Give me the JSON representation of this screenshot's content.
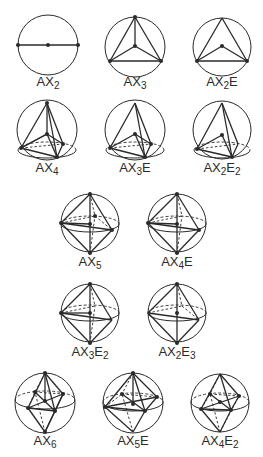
{
  "figure": {
    "ink_color": "#2a2a2a",
    "background": "#ffffff"
  },
  "diagrams": [
    {
      "id": "ax2",
      "label": {
        "base": "AX",
        "sub1": "2",
        "mid": "",
        "sub2": ""
      },
      "circle": {
        "cx": 48,
        "cy": 45,
        "r": 30
      },
      "label_pos": {
        "x": 48,
        "y": 86
      },
      "solid": [
        [
          18,
          45,
          78,
          45
        ]
      ],
      "dashed": [],
      "ellipses": [],
      "dots": [
        [
          18,
          45
        ],
        [
          48,
          45
        ],
        [
          78,
          45
        ]
      ]
    },
    {
      "id": "ax3",
      "label": {
        "base": "AX",
        "sub1": "3",
        "mid": "",
        "sub2": ""
      },
      "circle": {
        "cx": 135,
        "cy": 47,
        "r": 30
      },
      "label_pos": {
        "x": 135,
        "y": 86
      },
      "solid": [
        [
          135,
          17,
          110,
          61
        ],
        [
          135,
          17,
          161,
          61
        ],
        [
          110,
          61,
          161,
          61
        ],
        [
          135,
          17,
          135,
          46
        ],
        [
          135,
          46,
          110,
          61
        ],
        [
          135,
          46,
          161,
          61
        ]
      ],
      "dashed": [],
      "ellipses": [],
      "dots": [
        [
          135,
          17
        ],
        [
          135,
          46
        ],
        [
          110,
          61
        ],
        [
          161,
          61
        ]
      ]
    },
    {
      "id": "ax2e",
      "label": {
        "base": "AX",
        "sub1": "2",
        "mid": "E",
        "sub2": ""
      },
      "circle": {
        "cx": 222,
        "cy": 47,
        "r": 29
      },
      "label_pos": {
        "x": 222,
        "y": 86
      },
      "solid": [
        [
          222,
          18,
          197,
          61
        ],
        [
          222,
          18,
          247,
          61
        ],
        [
          197,
          61,
          247,
          61
        ],
        [
          222,
          46,
          197,
          61
        ],
        [
          222,
          46,
          247,
          61
        ]
      ],
      "dashed": [],
      "ellipses": [],
      "dots": [
        [
          222,
          46
        ],
        [
          197,
          61
        ],
        [
          247,
          61
        ]
      ]
    },
    {
      "id": "ax4",
      "label": {
        "base": "AX",
        "sub1": "4",
        "mid": "",
        "sub2": ""
      },
      "circle": {
        "cx": 47,
        "cy": 130,
        "r": 30
      },
      "label_pos": {
        "x": 47,
        "y": 172
      },
      "solid": [
        [
          47,
          103,
          21,
          148
        ],
        [
          47,
          103,
          57,
          157
        ],
        [
          47,
          103,
          63,
          144
        ],
        [
          47,
          103,
          47,
          134
        ],
        [
          47,
          134,
          21,
          148
        ],
        [
          47,
          134,
          57,
          157
        ],
        [
          47,
          134,
          63,
          144
        ],
        [
          21,
          148,
          57,
          157
        ],
        [
          57,
          157,
          63,
          144
        ],
        [
          21,
          148,
          47,
          134
        ]
      ],
      "dashed": [
        [
          21,
          148,
          63,
          144
        ]
      ],
      "ellipses": [
        {
          "cx": 47,
          "cy": 150,
          "rx": 29,
          "ry": 8,
          "dashed_back": true
        }
      ],
      "dots": [
        [
          47,
          103
        ],
        [
          47,
          134
        ],
        [
          21,
          148
        ],
        [
          57,
          157
        ],
        [
          63,
          144
        ]
      ]
    },
    {
      "id": "ax3e",
      "label": {
        "base": "AX",
        "sub1": "3",
        "mid": "E",
        "sub2": ""
      },
      "circle": {
        "cx": 135,
        "cy": 130,
        "r": 30
      },
      "label_pos": {
        "x": 135,
        "y": 172
      },
      "solid": [
        [
          135,
          103,
          110,
          148
        ],
        [
          135,
          103,
          145,
          157
        ],
        [
          135,
          103,
          151,
          144
        ],
        [
          135,
          134,
          110,
          148
        ],
        [
          135,
          134,
          145,
          157
        ],
        [
          135,
          134,
          151,
          144
        ],
        [
          110,
          148,
          145,
          157
        ],
        [
          145,
          157,
          151,
          144
        ]
      ],
      "dashed": [
        [
          110,
          148,
          151,
          144
        ]
      ],
      "ellipses": [
        {
          "cx": 135,
          "cy": 150,
          "rx": 29,
          "ry": 8,
          "dashed_back": true
        }
      ],
      "dots": [
        [
          135,
          134
        ],
        [
          110,
          148
        ],
        [
          145,
          157
        ],
        [
          151,
          144
        ]
      ]
    },
    {
      "id": "ax2e2",
      "label": {
        "base": "AX",
        "sub1": "2",
        "mid": "E",
        "sub2": "2"
      },
      "circle": {
        "cx": 222,
        "cy": 130,
        "r": 29
      },
      "label_pos": {
        "x": 222,
        "y": 172
      },
      "solid": [
        [
          222,
          103,
          197,
          149
        ],
        [
          222,
          103,
          232,
          157
        ],
        [
          222,
          103,
          238,
          144
        ],
        [
          222,
          135,
          197,
          149
        ],
        [
          222,
          135,
          232,
          157
        ],
        [
          197,
          149,
          232,
          157
        ],
        [
          232,
          157,
          238,
          144
        ]
      ],
      "dashed": [
        [
          197,
          149,
          238,
          144
        ]
      ],
      "ellipses": [
        {
          "cx": 222,
          "cy": 150,
          "rx": 28,
          "ry": 8,
          "dashed_back": true
        }
      ],
      "dots": [
        [
          222,
          135
        ],
        [
          197,
          149
        ],
        [
          232,
          157
        ]
      ]
    },
    {
      "id": "ax5",
      "label": {
        "base": "AX",
        "sub1": "5",
        "mid": "",
        "sub2": ""
      },
      "circle": {
        "cx": 90,
        "cy": 223,
        "r": 29
      },
      "label_pos": {
        "x": 90,
        "y": 266
      },
      "solid": [
        [
          90,
          194,
          61,
          223
        ],
        [
          90,
          194,
          112,
          230
        ],
        [
          90,
          253,
          61,
          223
        ],
        [
          90,
          253,
          112,
          230
        ],
        [
          90,
          194,
          90,
          253
        ],
        [
          61,
          223,
          112,
          230
        ],
        [
          61,
          223,
          90,
          224
        ]
      ],
      "dashed": [
        [
          90,
          194,
          95,
          216
        ],
        [
          90,
          253,
          95,
          216
        ],
        [
          61,
          223,
          95,
          216
        ],
        [
          95,
          216,
          112,
          230
        ]
      ],
      "ellipses": [
        {
          "cx": 90,
          "cy": 224,
          "rx": 29,
          "ry": 8,
          "dashed_back": true
        }
      ],
      "dots": [
        [
          90,
          194
        ],
        [
          90,
          253
        ],
        [
          90,
          224
        ],
        [
          61,
          223
        ],
        [
          112,
          230
        ],
        [
          95,
          216
        ]
      ]
    },
    {
      "id": "ax4e",
      "label": {
        "base": "AX",
        "sub1": "4",
        "mid": "E",
        "sub2": ""
      },
      "circle": {
        "cx": 177,
        "cy": 223,
        "r": 29
      },
      "label_pos": {
        "x": 177,
        "y": 266
      },
      "solid": [
        [
          177,
          194,
          148,
          223
        ],
        [
          177,
          194,
          199,
          230
        ],
        [
          177,
          253,
          148,
          223
        ],
        [
          177,
          253,
          199,
          230
        ],
        [
          177,
          194,
          177,
          253
        ],
        [
          148,
          223,
          199,
          230
        ],
        [
          148,
          223,
          177,
          224
        ]
      ],
      "dashed": [
        [
          177,
          194,
          182,
          216
        ],
        [
          177,
          253,
          182,
          216
        ],
        [
          148,
          223,
          182,
          216
        ]
      ],
      "ellipses": [
        {
          "cx": 177,
          "cy": 224,
          "rx": 29,
          "ry": 8,
          "dashed_back": true
        }
      ],
      "dots": [
        [
          177,
          194
        ],
        [
          177,
          253
        ],
        [
          177,
          224
        ],
        [
          148,
          223
        ],
        [
          199,
          230
        ]
      ]
    },
    {
      "id": "ax3e2",
      "label": {
        "base": "AX",
        "sub1": "3",
        "mid": "E",
        "sub2": "2"
      },
      "circle": {
        "cx": 90,
        "cy": 313,
        "r": 29
      },
      "label_pos": {
        "x": 90,
        "y": 356
      },
      "solid": [
        [
          90,
          284,
          61,
          313
        ],
        [
          90,
          284,
          112,
          320
        ],
        [
          90,
          343,
          61,
          313
        ],
        [
          90,
          343,
          112,
          320
        ],
        [
          90,
          284,
          90,
          343
        ],
        [
          61,
          313,
          112,
          320
        ],
        [
          61,
          313,
          90,
          313
        ]
      ],
      "dashed": [
        [
          90,
          284,
          95,
          306
        ],
        [
          90,
          343,
          95,
          306
        ],
        [
          61,
          313,
          95,
          306
        ]
      ],
      "ellipses": [
        {
          "cx": 90,
          "cy": 313,
          "rx": 29,
          "ry": 8,
          "dashed_back": true
        }
      ],
      "dots": [
        [
          90,
          284
        ],
        [
          90,
          343
        ],
        [
          90,
          313
        ],
        [
          61,
          313
        ]
      ]
    },
    {
      "id": "ax2e3",
      "label": {
        "base": "AX",
        "sub1": "2",
        "mid": "E",
        "sub2": "3"
      },
      "circle": {
        "cx": 177,
        "cy": 313,
        "r": 29
      },
      "label_pos": {
        "x": 177,
        "y": 356
      },
      "solid": [
        [
          177,
          284,
          148,
          313
        ],
        [
          177,
          284,
          199,
          320
        ],
        [
          177,
          343,
          148,
          313
        ],
        [
          177,
          343,
          199,
          320
        ],
        [
          177,
          284,
          177,
          343
        ],
        [
          148,
          313,
          199,
          320
        ]
      ],
      "dashed": [
        [
          177,
          284,
          182,
          306
        ],
        [
          148,
          313,
          182,
          306
        ],
        [
          182,
          306,
          199,
          320
        ]
      ],
      "ellipses": [
        {
          "cx": 177,
          "cy": 313,
          "rx": 29,
          "ry": 8,
          "dashed_back": true
        }
      ],
      "dots": [
        [
          177,
          284
        ],
        [
          177,
          343
        ],
        [
          177,
          313
        ]
      ]
    },
    {
      "id": "ax6",
      "label": {
        "base": "AX",
        "sub1": "6",
        "mid": "",
        "sub2": ""
      },
      "circle": {
        "cx": 45,
        "cy": 403,
        "r": 30
      },
      "label_pos": {
        "x": 45,
        "y": 445
      },
      "solid": [
        [
          45,
          373,
          28,
          408
        ],
        [
          45,
          373,
          55,
          411
        ],
        [
          45,
          373,
          63,
          394
        ],
        [
          45,
          432,
          28,
          408
        ],
        [
          45,
          432,
          55,
          411
        ],
        [
          45,
          432,
          63,
          394
        ],
        [
          28,
          408,
          55,
          411
        ],
        [
          55,
          411,
          63,
          394
        ],
        [
          45,
          373,
          45,
          401
        ],
        [
          28,
          408,
          63,
          394
        ],
        [
          35,
          392,
          55,
          411
        ]
      ],
      "dashed": [
        [
          45,
          373,
          35,
          392
        ],
        [
          45,
          432,
          35,
          392
        ],
        [
          35,
          392,
          63,
          394
        ],
        [
          28,
          408,
          35,
          392
        ]
      ],
      "ellipses": [
        {
          "cx": 45,
          "cy": 400,
          "rx": 30,
          "ry": 9,
          "dashed_back": true
        }
      ],
      "dots": [
        [
          45,
          373
        ],
        [
          45,
          432
        ],
        [
          45,
          401
        ],
        [
          35,
          392
        ],
        [
          63,
          394
        ],
        [
          28,
          408
        ],
        [
          55,
          411
        ]
      ]
    },
    {
      "id": "ax5e",
      "label": {
        "base": "AX",
        "sub1": "5",
        "mid": "E",
        "sub2": ""
      },
      "circle": {
        "cx": 133,
        "cy": 403,
        "r": 30
      },
      "label_pos": {
        "x": 133,
        "y": 445
      },
      "solid": [
        [
          133,
          373,
          105,
          407
        ],
        [
          133,
          373,
          145,
          411
        ],
        [
          133,
          373,
          157,
          397
        ],
        [
          133,
          373,
          133,
          404
        ],
        [
          133,
          432,
          105,
          407
        ],
        [
          133,
          432,
          145,
          411
        ],
        [
          105,
          407,
          145,
          411
        ],
        [
          145,
          411,
          157,
          397
        ],
        [
          105,
          407,
          157,
          397
        ],
        [
          122,
          394,
          145,
          411
        ]
      ],
      "dashed": [
        [
          133,
          373,
          122,
          394
        ],
        [
          133,
          432,
          122,
          394
        ],
        [
          122,
          394,
          157,
          397
        ],
        [
          105,
          407,
          122,
          394
        ]
      ],
      "ellipses": [
        {
          "cx": 133,
          "cy": 402,
          "rx": 30,
          "ry": 9,
          "dashed_back": true
        }
      ],
      "dots": [
        [
          133,
          373
        ],
        [
          133,
          404
        ],
        [
          122,
          394
        ],
        [
          157,
          397
        ],
        [
          105,
          407
        ],
        [
          145,
          411
        ]
      ]
    },
    {
      "id": "ax4e2",
      "label": {
        "base": "AX",
        "sub1": "4",
        "mid": "E",
        "sub2": "2"
      },
      "circle": {
        "cx": 220,
        "cy": 403,
        "r": 29
      },
      "label_pos": {
        "x": 220,
        "y": 445
      },
      "solid": [
        [
          220,
          374,
          201,
          409
        ],
        [
          220,
          374,
          231,
          410
        ],
        [
          220,
          374,
          239,
          396
        ],
        [
          220,
          432,
          201,
          409
        ],
        [
          220,
          432,
          231,
          410
        ],
        [
          201,
          409,
          231,
          410
        ],
        [
          231,
          410,
          239,
          396
        ],
        [
          201,
          409,
          239,
          396
        ],
        [
          210,
          394,
          231,
          410
        ]
      ],
      "dashed": [
        [
          220,
          374,
          210,
          394
        ],
        [
          220,
          432,
          210,
          394
        ],
        [
          210,
          394,
          239,
          396
        ],
        [
          201,
          409,
          210,
          394
        ],
        [
          220,
          432,
          239,
          396
        ]
      ],
      "ellipses": [
        {
          "cx": 220,
          "cy": 402,
          "rx": 29,
          "ry": 9,
          "dashed_back": true
        }
      ],
      "dots": [
        [
          220,
          402
        ],
        [
          210,
          394
        ],
        [
          239,
          396
        ],
        [
          201,
          409
        ],
        [
          231,
          410
        ]
      ]
    }
  ]
}
